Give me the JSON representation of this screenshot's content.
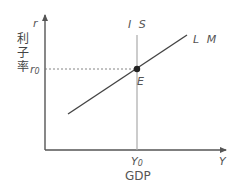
{
  "diagram": {
    "y_axis": {
      "symbol": "r",
      "label": "利子率",
      "tick_symbol": "r",
      "tick_subscript": "0"
    },
    "x_axis": {
      "symbol": "Y",
      "label": "GDP",
      "tick_symbol": "Y",
      "tick_subscript": "0"
    },
    "curves": {
      "is": {
        "label": "I S",
        "color": "#aaaaaa"
      },
      "lm": {
        "label": "L M",
        "color": "#444444"
      }
    },
    "equilibrium": {
      "label": "E",
      "color": "#222222"
    },
    "colors": {
      "axis": "#555555",
      "guide": "#777777"
    }
  }
}
